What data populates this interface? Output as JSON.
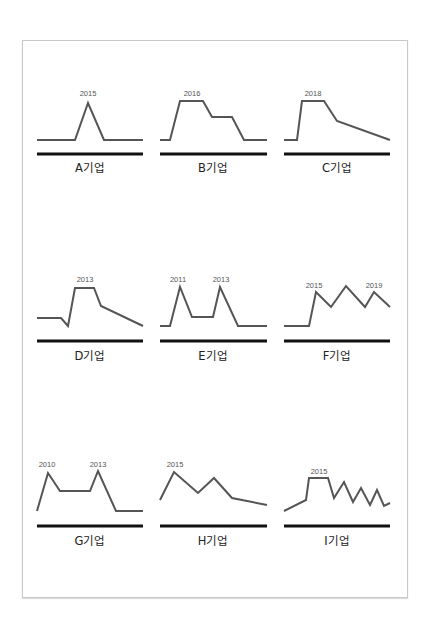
{
  "chart_data": [
    {
      "type": "line",
      "title": "A기업",
      "annotations": [
        {
          "text": "2015",
          "x": 88,
          "y": 96
        }
      ],
      "points": [
        [
          37,
          140
        ],
        [
          75,
          140
        ],
        [
          88,
          103
        ],
        [
          104,
          140
        ],
        [
          143,
          140
        ]
      ],
      "baseline": {
        "x1": 37,
        "x2": 143,
        "y": 154
      },
      "label_pos": [
        90,
        172
      ]
    },
    {
      "type": "line",
      "title": "B기업",
      "annotations": [
        {
          "text": "2016",
          "x": 192,
          "y": 96
        }
      ],
      "points": [
        [
          160,
          140
        ],
        [
          170,
          140
        ],
        [
          180,
          101
        ],
        [
          203,
          101
        ],
        [
          212,
          117
        ],
        [
          232,
          117
        ],
        [
          244,
          140
        ],
        [
          267,
          140
        ]
      ],
      "baseline": {
        "x1": 160,
        "x2": 267,
        "y": 154
      },
      "label_pos": [
        213,
        172
      ]
    },
    {
      "type": "line",
      "title": "C기업",
      "annotations": [
        {
          "text": "2018",
          "x": 313,
          "y": 96
        }
      ],
      "points": [
        [
          284,
          140
        ],
        [
          297,
          140
        ],
        [
          302,
          101
        ],
        [
          324,
          101
        ],
        [
          337,
          121
        ],
        [
          390,
          140
        ]
      ],
      "baseline": {
        "x1": 284,
        "x2": 390,
        "y": 154
      },
      "label_pos": [
        337,
        172
      ]
    },
    {
      "type": "line",
      "title": "D기업",
      "annotations": [
        {
          "text": "2013",
          "x": 85,
          "y": 282
        }
      ],
      "points": [
        [
          37,
          318
        ],
        [
          61,
          318
        ],
        [
          68,
          326
        ],
        [
          75,
          288
        ],
        [
          94,
          288
        ],
        [
          101,
          306
        ],
        [
          143,
          326
        ]
      ],
      "baseline": {
        "x1": 37,
        "x2": 143,
        "y": 341
      },
      "label_pos": [
        90,
        360
      ]
    },
    {
      "type": "line",
      "title": "E기업",
      "annotations": [
        {
          "text": "2011",
          "x": 178,
          "y": 282
        },
        {
          "text": "2013",
          "x": 221,
          "y": 282
        }
      ],
      "points": [
        [
          160,
          326
        ],
        [
          170,
          326
        ],
        [
          180,
          287
        ],
        [
          192,
          317
        ],
        [
          213,
          317
        ],
        [
          220,
          287
        ],
        [
          238,
          326
        ],
        [
          267,
          326
        ]
      ],
      "baseline": {
        "x1": 160,
        "x2": 267,
        "y": 341
      },
      "label_pos": [
        213,
        360
      ]
    },
    {
      "type": "line",
      "title": "F기업",
      "annotations": [
        {
          "text": "2015",
          "x": 314,
          "y": 288
        },
        {
          "text": "2019",
          "x": 374,
          "y": 288
        }
      ],
      "points": [
        [
          284,
          326
        ],
        [
          309,
          326
        ],
        [
          316,
          292
        ],
        [
          331,
          307
        ],
        [
          346,
          286
        ],
        [
          365,
          307
        ],
        [
          374,
          292
        ],
        [
          390,
          307
        ]
      ],
      "baseline": {
        "x1": 284,
        "x2": 390,
        "y": 341
      },
      "label_pos": [
        337,
        360
      ]
    },
    {
      "type": "line",
      "title": "G기업",
      "annotations": [
        {
          "text": "2010",
          "x": 47,
          "y": 467
        },
        {
          "text": "2013",
          "x": 98,
          "y": 467
        }
      ],
      "points": [
        [
          37,
          511
        ],
        [
          48,
          473
        ],
        [
          60,
          491
        ],
        [
          90,
          491
        ],
        [
          98,
          471
        ],
        [
          116,
          511
        ],
        [
          143,
          511
        ]
      ],
      "baseline": {
        "x1": 37,
        "x2": 143,
        "y": 526
      },
      "label_pos": [
        90,
        545
      ]
    },
    {
      "type": "line",
      "title": "H기업",
      "annotations": [
        {
          "text": "2015",
          "x": 175,
          "y": 467
        }
      ],
      "points": [
        [
          160,
          500
        ],
        [
          174,
          472
        ],
        [
          198,
          493
        ],
        [
          214,
          478
        ],
        [
          232,
          498
        ],
        [
          267,
          505
        ]
      ],
      "baseline": {
        "x1": 160,
        "x2": 267,
        "y": 526
      },
      "label_pos": [
        213,
        545
      ]
    },
    {
      "type": "line",
      "title": "I기업",
      "annotations": [
        {
          "text": "2015",
          "x": 319,
          "y": 474
        }
      ],
      "points": [
        [
          284,
          511
        ],
        [
          306,
          500
        ],
        [
          309,
          478
        ],
        [
          328,
          478
        ],
        [
          334,
          498
        ],
        [
          344,
          482
        ],
        [
          353,
          502
        ],
        [
          361,
          488
        ],
        [
          370,
          505
        ],
        [
          377,
          490
        ],
        [
          384,
          506
        ],
        [
          390,
          503
        ]
      ],
      "baseline": {
        "x1": 284,
        "x2": 390,
        "y": 526
      },
      "label_pos": [
        337,
        545
      ]
    }
  ],
  "colors": {
    "line": "#555555",
    "baseline": "#111111",
    "frame": "#c8c8c8"
  }
}
